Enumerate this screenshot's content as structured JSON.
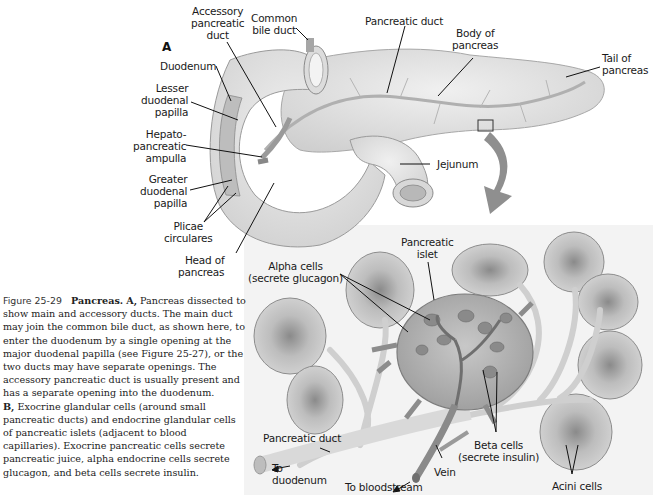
{
  "figure": {
    "number": "Figure 25-29",
    "title": "Pancreas.",
    "caption": {
      "part_a_marker": "A,",
      "part_a_text": "Pancreas dissected to show main and accessory ducts. The main duct may join the common bile duct, as shown here, to enter the duodenum by a single opening at the major duodenal papilla (see Figure 25-27), or the two ducts may have separate openings. The accessory pancreatic duct is usually present and has a separate opening into the duodenum.",
      "part_b_marker": "B,",
      "part_b_text": "Exocrine glandular cells (around small pancreatic ducts) and endocrine glandular cells of pancreatic islets (adjacent to blood capillaries). Exocrine pancreatic cells secrete pancreatic juice, alpha endocrine cells secrete glucagon, and beta cells secrete insulin."
    }
  },
  "panel_a": {
    "letter": "A",
    "labels": {
      "accessory_pancreatic_duct": "Accessory\npancreatic\nduct",
      "common_bile_duct": "Common\nbile duct",
      "pancreatic_duct": "Pancreatic duct",
      "body_of_pancreas": "Body of\npancreas",
      "tail_of_pancreas": "Tail of\npancreas",
      "duodenum": "Duodenum",
      "lesser_duodenal_papilla": "Lesser\nduodenal\npapilla",
      "hepatopancreatic_ampulla": "Hepato-\npancreatic\nampulla",
      "greater_duodenal_papilla": "Greater\nduodenal\npapilla",
      "plicae_circulares": "Plicae\ncirculares",
      "head_of_pancreas": "Head of\npancreas",
      "jejunum": "Jejunum"
    }
  },
  "panel_b": {
    "labels": {
      "pancreatic_islet": "Pancreatic\nislet",
      "alpha_cells": "Alpha cells\n(secrete glucagon)",
      "pancreatic_duct": "Pancreatic duct",
      "to_duodenum": "To\nduodenum",
      "to_bloodstream": "To bloodstream",
      "vein": "Vein",
      "beta_cells": "Beta cells\n(secrete insulin)",
      "acini_cells": "Acini cells"
    }
  },
  "colors": {
    "background": "#ffffff",
    "panel_b_background": "#f3f3f3",
    "organ_fill": "#e4e4e4",
    "organ_stroke": "#9a9a9a",
    "duct": "#b8b8b8",
    "islet": "#a9a9a9",
    "arrow": "#8c8c8c",
    "text": "#1a1a1a"
  }
}
